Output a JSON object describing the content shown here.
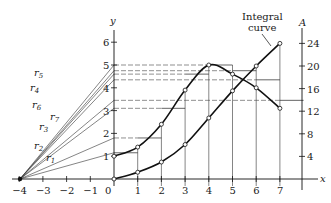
{
  "figure": {
    "type": "graphical integration diagram",
    "integral_label_line1": "Integral",
    "integral_label_line2": "curve",
    "x_axis_label": "x",
    "y_axis_label": "y",
    "a_axis_label": "A",
    "x_ticks": [
      "−4",
      "−3",
      "−2",
      "−1",
      "0",
      "1",
      "2",
      "3",
      "4",
      "5",
      "6",
      "7"
    ],
    "y_ticks": [
      "1",
      "2",
      "3",
      "4",
      "5",
      "6"
    ],
    "a_ticks": [
      "4",
      "8",
      "12",
      "16",
      "20",
      "24"
    ],
    "ray_labels": [
      "r1",
      "r2",
      "r3",
      "r7",
      "r6",
      "r4",
      "r5"
    ],
    "pole": {
      "x": -4,
      "y": 0
    }
  },
  "chart_data": {
    "type": "line",
    "title": "",
    "xlabel": "x",
    "ylabel": "y",
    "y2label": "A",
    "xlim": [
      -4,
      7
    ],
    "ylim": [
      0,
      6.5
    ],
    "y2lim": [
      0,
      26
    ],
    "series": [
      {
        "name": "y (integrand curve)",
        "axis": "y",
        "x": [
          0,
          1,
          2,
          3,
          4,
          5,
          6,
          7
        ],
        "values": [
          1.0,
          1.4,
          2.4,
          3.9,
          5.0,
          4.6,
          4.0,
          3.1
        ]
      },
      {
        "name": "Integral curve A",
        "axis": "A",
        "x": [
          0,
          1,
          2,
          3,
          4,
          5,
          6,
          7
        ],
        "values": [
          0,
          1.2,
          3.0,
          6.1,
          10.8,
          15.6,
          20.0,
          24.0
        ]
      }
    ],
    "step_midpoint_ordinates": [
      1.15,
      1.8,
      3.1,
      4.6,
      5.0,
      4.75,
      4.35,
      3.45
    ],
    "rays": [
      "r1",
      "r2",
      "r3",
      "r7",
      "r6",
      "r4",
      "r5"
    ],
    "annotations": [
      "Integral curve"
    ]
  }
}
